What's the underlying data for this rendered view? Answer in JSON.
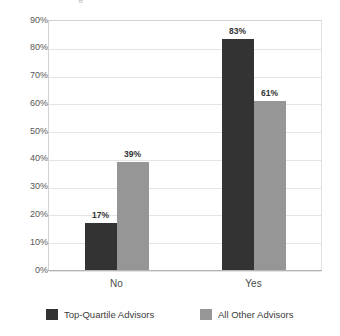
{
  "chart_data": {
    "type": "bar",
    "title": "",
    "xlabel": "",
    "ylabel": "",
    "ylim": [
      0,
      90
    ],
    "ytick_labels": [
      "90%",
      "80%",
      "70%",
      "60%",
      "50%",
      "40%",
      "30%",
      "20%",
      "10%",
      "0%"
    ],
    "ytick_values": [
      90,
      80,
      70,
      60,
      50,
      40,
      30,
      20,
      10,
      0
    ],
    "grid": true,
    "legend_position": "bottom",
    "categories": [
      "No",
      "Yes"
    ],
    "series": [
      {
        "name": "Top-Quartile Advisors",
        "color": "#333333",
        "values": [
          17,
          83
        ],
        "labels": [
          "17%",
          "83%"
        ]
      },
      {
        "name": "All Other Advisors",
        "color": "#969696",
        "values": [
          39,
          61
        ],
        "labels": [
          "39%",
          "61%"
        ]
      }
    ]
  },
  "axis": {
    "ticks": [
      {
        "label": "90%"
      },
      {
        "label": "80%"
      },
      {
        "label": "70%"
      },
      {
        "label": "60%"
      },
      {
        "label": "50%"
      },
      {
        "label": "40%"
      },
      {
        "label": "30%"
      },
      {
        "label": "20%"
      },
      {
        "label": "10%"
      },
      {
        "label": "0%"
      }
    ]
  },
  "categories": [
    {
      "label": "No"
    },
    {
      "label": "Yes"
    }
  ],
  "legend": {
    "items": [
      {
        "label": "Top-Quartile Advisors",
        "color": "#333333"
      },
      {
        "label": "All Other Advisors",
        "color": "#969696"
      }
    ]
  },
  "bars": [
    {
      "label": "17%",
      "series": "Top-Quartile Advisors",
      "category": "No",
      "value": 17
    },
    {
      "label": "39%",
      "series": "All Other Advisors",
      "category": "No",
      "value": 39
    },
    {
      "label": "83%",
      "series": "Top-Quartile Advisors",
      "category": "Yes",
      "value": 83
    },
    {
      "label": "61%",
      "series": "All Other Advisors",
      "category": "Yes",
      "value": 61
    }
  ],
  "title_remnant": "g"
}
